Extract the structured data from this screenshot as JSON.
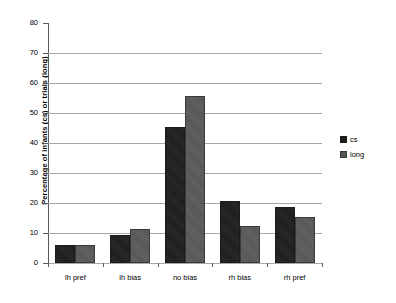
{
  "chart_data": {
    "type": "bar",
    "title": "",
    "xlabel": "",
    "ylabel": "Percentage of infants (cs) or trials (long)",
    "ylim": [
      0,
      80
    ],
    "ytick_step": 10,
    "yticks": [
      0,
      10,
      20,
      30,
      40,
      50,
      60,
      70,
      80
    ],
    "grid": true,
    "grid_axis": "y",
    "legend_position": "right",
    "categories": [
      "lh pref",
      "lh bias",
      "no bias",
      "rh bias",
      "rh pref"
    ],
    "series": [
      {
        "name": "cs",
        "color": "#1d1d1d",
        "values": [
          6,
          9.3,
          45.3,
          20.7,
          18.7
        ]
      },
      {
        "name": "long",
        "color": "#565656",
        "values": [
          6,
          11.3,
          55.7,
          12.3,
          15.3
        ]
      }
    ]
  },
  "axis": {
    "y_title": "Percentage of infants (cs) or trials (long)",
    "tick_labels": [
      "80",
      "70",
      "60",
      "50",
      "40",
      "30",
      "20",
      "10",
      "0"
    ]
  },
  "legend": {
    "entries": [
      {
        "label": "cs"
      },
      {
        "label": "long"
      }
    ]
  },
  "colors": {
    "cs": "#1d1d1d",
    "long": "#565656",
    "gridline": "#a8a8a8",
    "axis": "#5a5a5a",
    "background": "#ffffff"
  }
}
